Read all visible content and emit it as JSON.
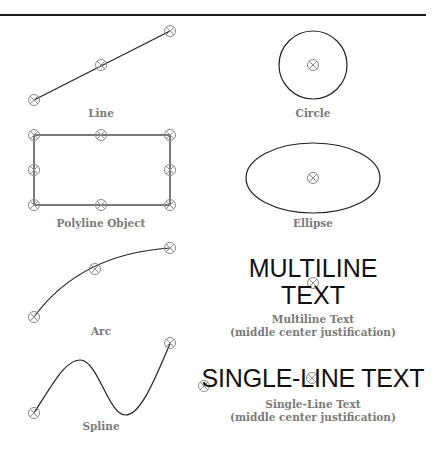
{
  "figure": {
    "stroke_color": "#222222",
    "grip_color": "#8a8a8a",
    "caption_color": "#7a7a7a",
    "objects": [
      {
        "name": "line",
        "caption": "Line",
        "caption_line2": ""
      },
      {
        "name": "circle",
        "caption": "Circle",
        "caption_line2": ""
      },
      {
        "name": "polyline",
        "caption": "Polyline Object",
        "caption_line2": ""
      },
      {
        "name": "ellipse",
        "caption": "Ellipse",
        "caption_line2": ""
      },
      {
        "name": "arc",
        "caption": "Arc",
        "caption_line2": ""
      },
      {
        "name": "multiline-text",
        "caption": "Multiline Text",
        "caption_line2": "(middle center justification)",
        "content_line1": "MULTILINE",
        "content_line2": "TEXT"
      },
      {
        "name": "spline",
        "caption": "Spline",
        "caption_line2": ""
      },
      {
        "name": "single-line-text",
        "caption": "Single-Line Text",
        "caption_line2": "(middle center justification)",
        "content": "SINGLE-LINE TEXT"
      }
    ]
  }
}
